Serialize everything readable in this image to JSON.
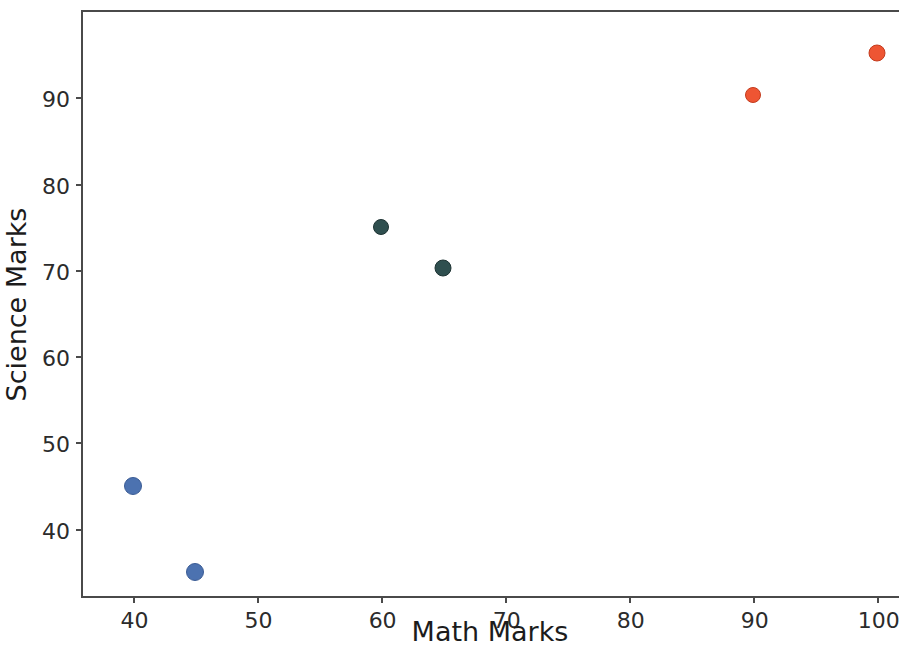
{
  "chart_data": {
    "type": "scatter",
    "title": "",
    "xlabel": "Math Marks",
    "ylabel": "Science Marks",
    "xlim": [
      36.0,
      101.8
    ],
    "ylim": [
      32.2,
      99.9
    ],
    "xticks": [
      40,
      50,
      60,
      70,
      80,
      90,
      100
    ],
    "xtick_labels": [
      "40",
      "50",
      "60",
      "70",
      "80",
      "90",
      "100"
    ],
    "yticks": [
      40,
      50,
      60,
      70,
      80,
      90
    ],
    "ytick_labels": [
      "40",
      "50",
      "60",
      "70",
      "80",
      "90"
    ],
    "grid": false,
    "legend": null,
    "colors": {
      "low": "#4c72b0",
      "mid": "#2f4f4f",
      "high": "#ee5533",
      "axis": "#4a4a4a",
      "text": "#2b2b2b",
      "background": "#ffffff"
    },
    "points": [
      {
        "x": 40,
        "y": 45,
        "color": "#4c72b0",
        "edge": "#3b5c95",
        "r": 9,
        "group": "low"
      },
      {
        "x": 45,
        "y": 35,
        "color": "#4c72b0",
        "edge": "#3b5c95",
        "r": 9,
        "group": "low"
      },
      {
        "x": 60,
        "y": 75,
        "color": "#2f4f4f",
        "edge": "#1e3333",
        "r": 8,
        "group": "mid"
      },
      {
        "x": 65,
        "y": 70.2,
        "color": "#2f4f4f",
        "edge": "#1e3333",
        "r": 8.5,
        "group": "mid"
      },
      {
        "x": 90,
        "y": 90.3,
        "color": "#ee5533",
        "edge": "#c43b1d",
        "r": 8,
        "group": "high"
      },
      {
        "x": 100,
        "y": 95.2,
        "color": "#ee5533",
        "edge": "#c43b1d",
        "r": 8.5,
        "group": "high"
      }
    ]
  }
}
